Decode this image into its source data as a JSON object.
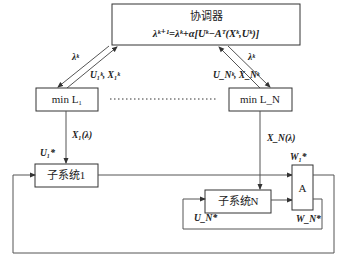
{
  "diagram": {
    "coordinator": {
      "title": "协调器",
      "equation": "λᵏ⁺¹=λᵏ+α[Uᵏ−Aᵀ(Xᵏ,Uᵏ)]"
    },
    "local_problems": [
      {
        "label": "min  L₁",
        "down_arrow_label": "λᵏ",
        "up_arrow_label": "U₁ᵏ, X₁ᵏ",
        "output_label": "X₁(λ)"
      },
      {
        "label": "min  L_N",
        "down_arrow_label": "λᵏ",
        "up_arrow_label": "U_Nᵏ, X_Nᵏ",
        "output_label": "X_N(λ)"
      }
    ],
    "subsystems": [
      {
        "label": "子系统1",
        "input_label": "U₁*"
      },
      {
        "label": "子系统N",
        "input_label": "U_N*"
      }
    ],
    "interconnection": {
      "label": "A",
      "output_labels": [
        "W₁*",
        "W_N*"
      ]
    },
    "ellipsis": "……"
  }
}
